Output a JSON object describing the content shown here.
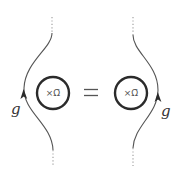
{
  "diagram": {
    "type": "knot-skein-relation",
    "colors": {
      "strand": "#555555",
      "loop": "#2b2b2b",
      "text": "#333333"
    },
    "lhs": {
      "strand_label": "g",
      "loop_label": "×Ω̄",
      "strand_side": "left-of-loop",
      "arrow_direction": "up"
    },
    "relation": "=",
    "rhs": {
      "strand_label": "g",
      "loop_label": "×Ω̄",
      "strand_side": "right-of-loop",
      "arrow_direction": "up"
    }
  }
}
